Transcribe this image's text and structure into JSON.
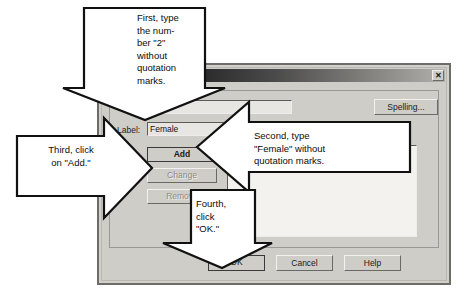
{
  "window": {
    "title": "Value Labels",
    "close_label": "✕",
    "app_icon": "spss-variable-icon"
  },
  "dialog": {
    "group_box_label": "Value Labels",
    "fields": [
      {
        "label": "Value:",
        "value": "2",
        "placeholder": ""
      },
      {
        "label": "Label:",
        "value": "Female",
        "placeholder": ""
      }
    ],
    "side_buttons": [
      {
        "label": "Add",
        "enabled": true
      },
      {
        "label": "Change",
        "enabled": false
      },
      {
        "label": "Remove",
        "enabled": false
      }
    ],
    "spelling_button": "Spelling...",
    "list_items": [
      "1.00 = \"Male\""
    ],
    "bottom_buttons": [
      {
        "label": "OK",
        "default": true
      },
      {
        "label": "Cancel",
        "default": false
      },
      {
        "label": "Help",
        "default": false
      }
    ]
  },
  "callouts": [
    {
      "id": "callout-1",
      "direction": "down",
      "text": "First, type\nthe num-\nber \"2\"\nwithout\nquotation\nmarks."
    },
    {
      "id": "callout-2",
      "direction": "left",
      "text": "Second, type\n\"Female\" without\nquotation marks."
    },
    {
      "id": "callout-3",
      "direction": "right",
      "text": "Third, click\non \"Add.\""
    },
    {
      "id": "callout-4",
      "direction": "down",
      "text": "Fourth,\nclick\n\"OK.\""
    }
  ],
  "colors": {
    "dialog_face": "#cfcdc8",
    "titlebar_dark": "#080808",
    "titlebar_light": "#b2b0ac",
    "field_background": "#e8e6e2",
    "list_background": "#f4f2ef",
    "disabled_text": "#8d8b87",
    "callout_fill": "#ffffff",
    "callout_stroke": "#111111"
  }
}
